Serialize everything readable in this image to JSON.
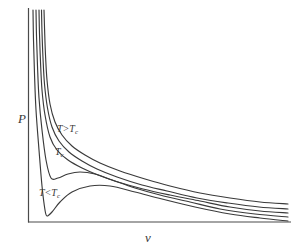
{
  "figure": {
    "background_color": "#ffffff",
    "line_color": "#3a3a3a",
    "axis_color": "#4a4a4a"
  },
  "axes": {
    "y_label": "P",
    "x_label": "v",
    "origin": [
      28,
      222
    ],
    "x_axis_end": [
      291,
      222
    ],
    "y_axis_top": [
      28,
      8
    ],
    "ticks": "none",
    "grid": "off"
  },
  "annotations": {
    "above_critical": {
      "text": "T>T",
      "sub": "c",
      "full": "T>Tc"
    },
    "critical": {
      "text": "T",
      "sub": "c",
      "full": "Tc"
    },
    "below_critical": {
      "text": "T<T",
      "sub": "c",
      "full": "T<Tc"
    }
  },
  "chart_data": {
    "type": "line",
    "xlabel": "v",
    "ylabel": "P",
    "xlim": [
      0,
      1
    ],
    "ylim": [
      0,
      1
    ],
    "grid": false,
    "legend_position": "inline-annotations",
    "series": [
      {
        "name": "T >> Tc",
        "label": "T>Tc",
        "kind": "supercritical",
        "points_px": [
          [
            44,
            10
          ],
          [
            44.6,
            30
          ],
          [
            45.5,
            55
          ],
          [
            47,
            80
          ],
          [
            50,
            104
          ],
          [
            55,
            122
          ],
          [
            62,
            135
          ],
          [
            72,
            146
          ],
          [
            85,
            155
          ],
          [
            100,
            163
          ],
          [
            120,
            171
          ],
          [
            145,
            179
          ],
          [
            170,
            186
          ],
          [
            200,
            193
          ],
          [
            230,
            198
          ],
          [
            260,
            202
          ],
          [
            288,
            204
          ]
        ]
      },
      {
        "name": "T > Tc",
        "label": "T>Tc",
        "kind": "supercritical",
        "points_px": [
          [
            41.5,
            10
          ],
          [
            42,
            32
          ],
          [
            43,
            58
          ],
          [
            44.5,
            84
          ],
          [
            47.5,
            108
          ],
          [
            52,
            127
          ],
          [
            59,
            141
          ],
          [
            69,
            152
          ],
          [
            82,
            161
          ],
          [
            97,
            169
          ],
          [
            117,
            177
          ],
          [
            142,
            185
          ],
          [
            167,
            191
          ],
          [
            197,
            198
          ],
          [
            228,
            203
          ],
          [
            259,
            207
          ],
          [
            288,
            209
          ]
        ]
      },
      {
        "name": "Tc (critical isotherm)",
        "label": "Tc",
        "kind": "critical",
        "inflection_px": [
          68,
          160
        ],
        "points_px": [
          [
            39,
            10
          ],
          [
            39.5,
            34
          ],
          [
            40.5,
            62
          ],
          [
            42,
            90
          ],
          [
            45,
            115
          ],
          [
            50,
            137
          ],
          [
            57,
            150
          ],
          [
            68,
            160
          ],
          [
            82,
            168
          ],
          [
            98,
            175
          ],
          [
            118,
            182
          ],
          [
            143,
            189
          ],
          [
            170,
            195
          ],
          [
            200,
            201
          ],
          [
            230,
            207
          ],
          [
            260,
            211
          ],
          [
            288,
            213
          ]
        ]
      },
      {
        "name": "T < Tc",
        "label": "T<Tc",
        "kind": "subcritical",
        "local_min_px": [
          51,
          178
        ],
        "local_max_px": [
          80,
          172
        ],
        "points_px": [
          [
            36,
            10
          ],
          [
            36.5,
            36
          ],
          [
            37.5,
            66
          ],
          [
            39,
            98
          ],
          [
            42,
            130
          ],
          [
            46,
            160
          ],
          [
            51,
            178
          ],
          [
            58,
            178
          ],
          [
            68,
            174
          ],
          [
            80,
            172
          ],
          [
            95,
            174
          ],
          [
            112,
            180
          ],
          [
            135,
            188
          ],
          [
            160,
            195
          ],
          [
            190,
            202
          ],
          [
            220,
            209
          ],
          [
            255,
            214
          ],
          [
            288,
            217
          ]
        ]
      },
      {
        "name": "T << Tc",
        "label": "T<Tc",
        "kind": "subcritical",
        "local_min_px": [
          47,
          216
        ],
        "local_max_px": [
          90,
          186
        ],
        "points_px": [
          [
            33,
            10
          ],
          [
            33.5,
            40
          ],
          [
            34.5,
            74
          ],
          [
            36,
            110
          ],
          [
            39,
            150
          ],
          [
            42,
            186
          ],
          [
            45,
            210
          ],
          [
            47,
            216
          ],
          [
            52,
            212
          ],
          [
            60,
            202
          ],
          [
            72,
            192
          ],
          [
            90,
            186
          ],
          [
            110,
            186
          ],
          [
            135,
            192
          ],
          [
            162,
            199
          ],
          [
            195,
            207
          ],
          [
            230,
            214
          ],
          [
            260,
            218
          ],
          [
            288,
            221
          ]
        ]
      }
    ]
  }
}
